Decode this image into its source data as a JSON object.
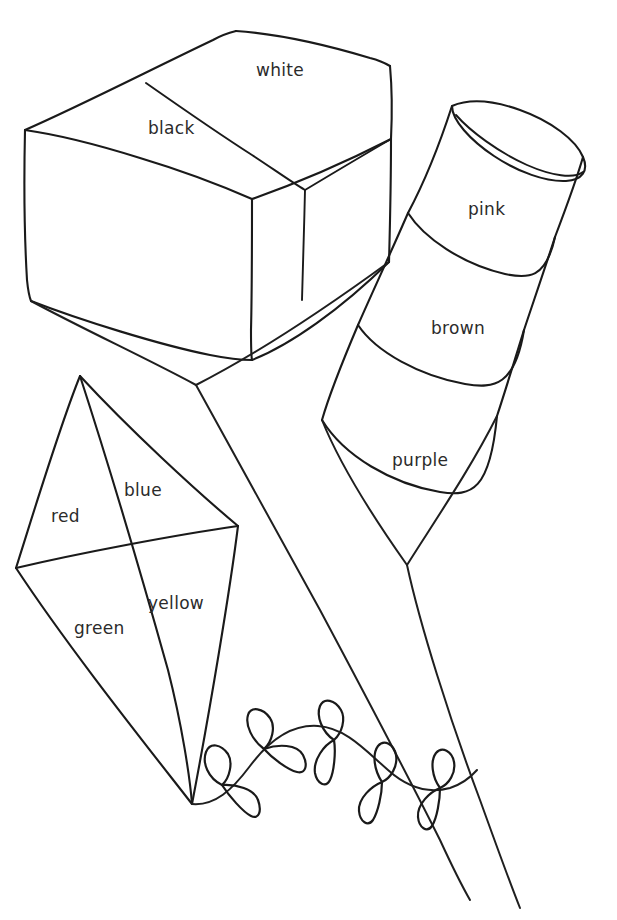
{
  "page": {
    "background_color": "#ffffff",
    "ink_color": "#1a1a1a",
    "text_color": "#2b2b2b",
    "width": 617,
    "height": 920
  },
  "objects": [
    {
      "name": "box",
      "shape": "cuboid",
      "labels": [
        {
          "id": "white",
          "text": "white",
          "x": 256,
          "y": 60
        },
        {
          "id": "black",
          "text": "black",
          "x": 148,
          "y": 118
        }
      ]
    },
    {
      "name": "cylinder",
      "shape": "banded-tube",
      "labels": [
        {
          "id": "pink",
          "text": "pink",
          "x": 468,
          "y": 199
        },
        {
          "id": "brown",
          "text": "brown",
          "x": 431,
          "y": 318
        },
        {
          "id": "purple",
          "text": "purple",
          "x": 392,
          "y": 450
        }
      ]
    },
    {
      "name": "kite",
      "shape": "diamond-kite",
      "labels": [
        {
          "id": "red",
          "text": "red",
          "x": 51,
          "y": 506
        },
        {
          "id": "blue",
          "text": "blue",
          "x": 124,
          "y": 480
        },
        {
          "id": "green",
          "text": "green",
          "x": 74,
          "y": 618
        },
        {
          "id": "yellow",
          "text": "yellow",
          "x": 148,
          "y": 593
        }
      ],
      "tail_bow_count": 5
    }
  ],
  "colour_words": [
    "white",
    "black",
    "pink",
    "brown",
    "purple",
    "red",
    "blue",
    "green",
    "yellow"
  ]
}
